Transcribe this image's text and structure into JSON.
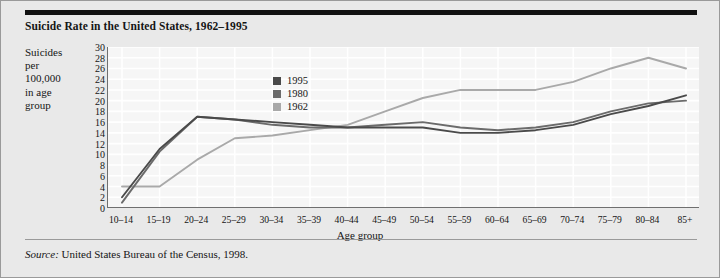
{
  "figure": {
    "title": "Suicide Rate in the United States, 1962–1995",
    "y_axis_caption_lines": [
      "Suicides",
      "per",
      "100,000",
      "in age",
      "group"
    ],
    "x_axis_title": "Age group",
    "source_prefix": "Source:",
    "source_text": "United States Bureau of the Census, 1998."
  },
  "colors": {
    "series_1995": "#4a4a4a",
    "series_1980": "#6b6b6b",
    "series_1962": "#a9a9a9",
    "plot_background": "#f6f6f6",
    "figure_background": "#e9e9e9",
    "axis": "#6f6f6f",
    "gridline": "#ffffff",
    "rule": "#111111"
  },
  "legend": {
    "position": "inside-top-left",
    "entries": [
      {
        "label": "1995",
        "color": "#4a4a4a"
      },
      {
        "label": "1980",
        "color": "#6b6b6b"
      },
      {
        "label": "1962",
        "color": "#a9a9a9"
      }
    ]
  },
  "chart_data": {
    "type": "line",
    "title": "Suicide Rate in the United States, 1962–1995",
    "xlabel": "Age group",
    "ylabel": "Suicides per 100,000 in age group",
    "ylim": [
      0,
      30
    ],
    "ytick_step": 2,
    "yticks": [
      0,
      2,
      4,
      6,
      8,
      10,
      12,
      14,
      16,
      18,
      20,
      22,
      24,
      26,
      28,
      30
    ],
    "grid": true,
    "categories": [
      "10–14",
      "15–19",
      "20–24",
      "25–29",
      "30–34",
      "35–39",
      "40–44",
      "45–49",
      "50–54",
      "55–59",
      "60–64",
      "65–69",
      "70–74",
      "75–79",
      "80–84",
      "85+"
    ],
    "series": [
      {
        "name": "1995",
        "color": "#4a4a4a",
        "values": [
          2,
          11,
          17,
          16.5,
          16,
          15.5,
          15,
          15,
          15,
          14,
          14,
          14.5,
          15.5,
          17.5,
          19,
          21
        ]
      },
      {
        "name": "1980",
        "color": "#6b6b6b",
        "values": [
          1,
          10.5,
          17,
          16.5,
          15.5,
          15,
          15,
          15.5,
          16,
          15,
          14.5,
          15,
          16,
          18,
          19.5,
          20
        ]
      },
      {
        "name": "1962",
        "color": "#a9a9a9",
        "values": [
          4,
          4,
          9,
          13,
          13.5,
          14.5,
          15.5,
          18,
          20.5,
          22,
          22,
          22,
          23.5,
          26,
          28,
          26
        ]
      }
    ]
  }
}
